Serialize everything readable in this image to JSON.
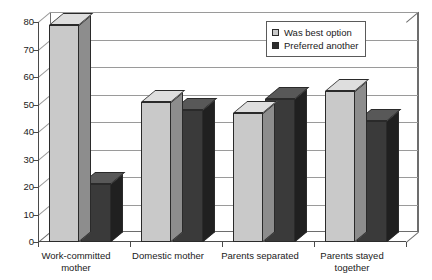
{
  "chart_data": {
    "type": "bar",
    "title": "",
    "subtitle": "",
    "xlabel": "",
    "ylabel": "",
    "ylim": [
      0,
      80
    ],
    "ytick_step": 10,
    "yticks": [
      "80",
      "70",
      "60",
      "50",
      "40",
      "30",
      "20",
      "10",
      "0"
    ],
    "grid": true,
    "legend_position": "top-right",
    "style": "3d-clustered-column",
    "categories": [
      "Work-committed mother",
      "Domestic mother",
      "Parents separated",
      "Parents stayed together"
    ],
    "series": [
      {
        "name": "Was best option",
        "color": "#c9c9c9",
        "values": [
          79,
          51,
          47,
          55
        ]
      },
      {
        "name": "Preferred another",
        "color": "#3a3a3a",
        "values": [
          21,
          48,
          52,
          44
        ]
      }
    ]
  },
  "legend": {
    "items": [
      {
        "label": "Was best option",
        "swatch": "light"
      },
      {
        "label": "Preferred another",
        "swatch": "dark"
      }
    ]
  },
  "colors": {
    "series_light": "#c9c9c9",
    "series_dark": "#3a3a3a",
    "axis": "#4a4a4a",
    "grid": "#9a9a9a",
    "background": "#ffffff"
  }
}
